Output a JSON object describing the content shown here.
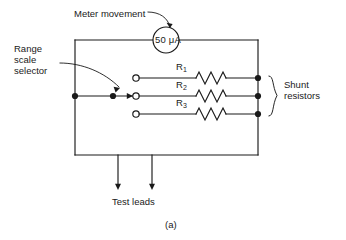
{
  "figure": {
    "caption": "(a)",
    "title_type": "circuit-schematic"
  },
  "meter": {
    "value": "50 μA",
    "label": "Meter movement",
    "shape": "circle",
    "center": {
      "x": 166,
      "y": 40
    },
    "radius": 13
  },
  "selector": {
    "label_line1": "Range",
    "label_line2": "scale",
    "label_line3": "selector",
    "label": "Range\nscale\nselector",
    "selected_contact": 2,
    "wiper_y": 96
  },
  "shunt": {
    "label_line1": "Shunt",
    "label_line2": "resistors",
    "label": "Shunt resistors",
    "brace_top": 78,
    "brace_bottom": 114
  },
  "resistors": [
    {
      "id": "R1",
      "label": "R",
      "subscript": "1",
      "y": 78,
      "contact_x": 136,
      "zigzag_x": 196
    },
    {
      "id": "R2",
      "label": "R",
      "subscript": "2",
      "y": 96,
      "contact_x": 136,
      "zigzag_x": 196
    },
    {
      "id": "R3",
      "label": "R",
      "subscript": "3",
      "y": 114,
      "contact_x": 136,
      "zigzag_x": 196
    }
  ],
  "test_leads": {
    "label": "Test leads",
    "lead_left_x": 118,
    "lead_right_x": 152,
    "arrow_tip_y": 188
  },
  "frame": {
    "left_x": 75,
    "right_x": 258,
    "top_y": 40,
    "bottom_y": 155
  },
  "colors": {
    "line": "#1a1a1a",
    "text": "#1a1a1a",
    "background": "#ffffff",
    "node_fill": "#1a1a1a",
    "contact_fill": "#ffffff"
  }
}
